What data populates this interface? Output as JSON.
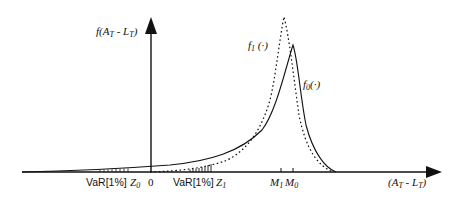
{
  "diagram": {
    "type": "probability-density-comparison",
    "y_axis_label": {
      "main": "f(A",
      "sub1": "T",
      "mid": " - L",
      "sub2": "T",
      "end": ")"
    },
    "x_axis_label": {
      "main": "(A",
      "sub1": "T",
      "mid": " - L",
      "sub2": "T",
      "end": ")"
    },
    "curves": [
      {
        "name": "f0",
        "label_main": "f",
        "label_sub": "0",
        "label_arg": "(·)",
        "style": "solid",
        "peak_label": "M0"
      },
      {
        "name": "f1",
        "label_main": "f",
        "label_sub": "1",
        "label_arg": " (·)",
        "style": "dotted",
        "peak_label": "M1"
      }
    ],
    "x_ticks": {
      "var0": {
        "text": "VaR[1%]",
        "z": "Z",
        "z_sub": "0"
      },
      "origin": "0",
      "var1": {
        "text": "VaR[1%]",
        "z": "Z",
        "z_sub": "1"
      },
      "m1": {
        "main": "M",
        "sub": "1"
      },
      "m0": {
        "main": "M",
        "sub": "0"
      }
    },
    "colors": {
      "line": "#111111",
      "background": "#ffffff"
    }
  }
}
